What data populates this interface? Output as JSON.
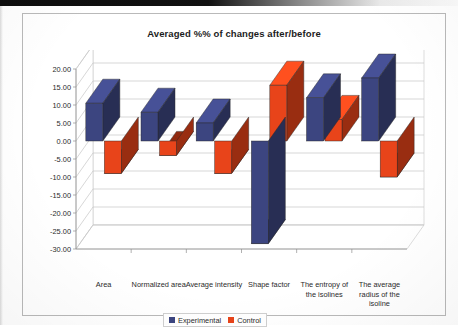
{
  "chart_data": {
    "type": "bar",
    "title": "Averaged %% of changes after/before",
    "xlabel": "",
    "ylabel": "",
    "ylim": [
      -30,
      20
    ],
    "ytick_step": 5,
    "grid": true,
    "legend_position": "bottom",
    "three_d": true,
    "categories": [
      "Area",
      "Normalized area",
      "Average intensity",
      "Shape factor",
      "The entropy of the isolines",
      "The average radius of the isoline"
    ],
    "ytick_labels": [
      "20.00",
      "15.00",
      "10.00",
      "5.00",
      "0.00",
      "-5.00",
      "-10.00",
      "-15.00",
      "-20.00",
      "-25.00",
      "-30.00"
    ],
    "series": [
      {
        "name": "Experimental",
        "color": "#3c4580",
        "values": [
          10.5,
          8.0,
          5.0,
          -28.5,
          12.0,
          17.5
        ]
      },
      {
        "name": "Control",
        "color": "#e8441a",
        "values": [
          -9.0,
          -4.0,
          -9.0,
          15.5,
          6.0,
          -10.0
        ]
      }
    ]
  },
  "legend": {
    "items": [
      {
        "label": "Experimental",
        "color": "#3c4580"
      },
      {
        "label": "Control",
        "color": "#e8441a"
      }
    ]
  }
}
